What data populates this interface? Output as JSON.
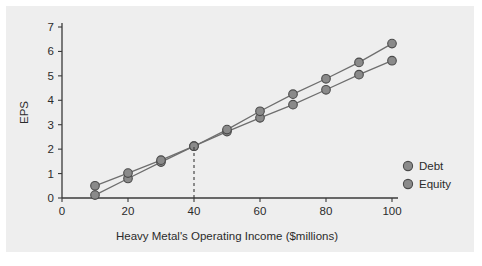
{
  "chart_data": {
    "type": "line",
    "title": "",
    "xlabel": "Heavy Metal's Operating Income ($millions)",
    "ylabel": "EPS",
    "x": [
      10,
      20,
      30,
      40,
      50,
      60,
      70,
      80,
      90,
      100
    ],
    "xlim": [
      0,
      100
    ],
    "ylim": [
      0,
      7
    ],
    "xticks": [
      "0",
      "20",
      "40",
      "60",
      "80",
      "100"
    ],
    "xtick_values": [
      0,
      20,
      40,
      60,
      80,
      100
    ],
    "yticks": [
      "0",
      "1",
      "2",
      "3",
      "4",
      "5",
      "6",
      "7"
    ],
    "ytick_values": [
      0,
      1,
      2,
      3,
      4,
      5,
      6,
      7
    ],
    "grid": false,
    "legend_position": "right",
    "series": [
      {
        "name": "Debt",
        "values": [
          0.12,
          0.8,
          1.47,
          2.12,
          2.72,
          3.28,
          3.82,
          4.43,
          5.05,
          5.62
        ],
        "marker_color": "#8a8a8a",
        "line_color": "#6e6e6e"
      },
      {
        "name": "Equity",
        "values": [
          0.5,
          1.02,
          1.55,
          2.12,
          2.8,
          3.55,
          4.25,
          4.88,
          5.55,
          6.32
        ],
        "marker_color": "#8a8a8a",
        "line_color": "#6e6e6e"
      }
    ],
    "annotations": [
      {
        "name": "crossover-line",
        "type": "vline",
        "x": 40,
        "style": "dashed",
        "y_from": 0,
        "y_to": 2.12
      }
    ]
  },
  "legend": {
    "items": [
      {
        "label": "Debt"
      },
      {
        "label": "Equity"
      }
    ]
  },
  "colors": {
    "panel_background": "#eeeeee",
    "page_background": "#ffffff",
    "axis": "#3a3a3a",
    "text": "#2b2b2b",
    "marker_fill": "#8a8a8a",
    "marker_stroke": "#4a4a4a",
    "line": "#6e6e6e"
  }
}
